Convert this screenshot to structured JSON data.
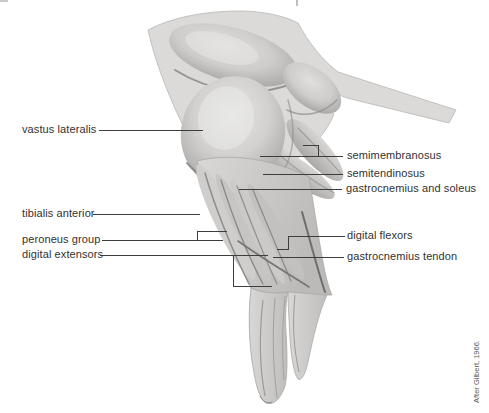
{
  "labels": {
    "vastus_lateralis": "vastus lateralis",
    "tibialis_anterior": "tibialis anterior",
    "peroneus_group": "peroneus group",
    "digital_extensors": "digital extensors",
    "semimembranosus": "semimembranosus",
    "semitendinosus": "semitendinosus",
    "gastrocnemius_and_soleus": "gastrocnemius and soleus",
    "digital_flexors": "digital flexors",
    "gastrocnemius_tendon": "gastrocnemius tendon"
  },
  "credit": "After Gilbert, 1966.",
  "colors": {
    "paper": "#ffffff",
    "label_ink": "#323232",
    "leader_line": "#3d3d3d",
    "credit_ink": "#5a5a5a",
    "illustration_light": "#dbdad8",
    "illustration_mid": "#c9c8c6",
    "illustration_shadow": "#8a8988"
  }
}
